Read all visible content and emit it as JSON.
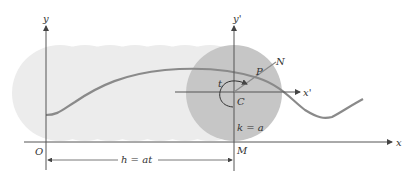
{
  "figure": {
    "colors": {
      "background": "#ffffff",
      "trail_band": "#ececec",
      "disk": "#c8c8c8",
      "curve": "#8a8a8a",
      "axes": "#555555",
      "text": "#333333"
    }
  },
  "labels": {
    "y_axis": "y",
    "x_axis": "x",
    "origin": "O",
    "y_prime": "y'",
    "x_prime": "x'",
    "center": "C",
    "point_p": "P",
    "point_n": "N",
    "angle": "t",
    "contact_point": "M",
    "radius_eq": "k = a",
    "distance_eq": "h = at"
  }
}
